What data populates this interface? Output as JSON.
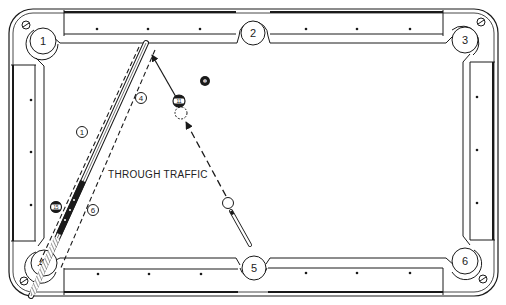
{
  "diagram": {
    "caption": "THROUGH TRAFFIC",
    "colors": {
      "ink": "#1a1a1a",
      "paper": "#ffffff"
    },
    "pockets": [
      {
        "number": "1",
        "position": "top-left"
      },
      {
        "number": "2",
        "position": "top-middle"
      },
      {
        "number": "3",
        "position": "top-right"
      },
      {
        "number": "4",
        "position": "bottom-left"
      },
      {
        "number": "5",
        "position": "bottom-middle"
      },
      {
        "number": "6",
        "position": "bottom-right"
      }
    ],
    "balls": [
      {
        "number": "8",
        "type": "solid-black"
      },
      {
        "number": "11",
        "type": "stripe"
      },
      {
        "number": "15",
        "type": "stripe"
      },
      {
        "number": "",
        "type": "cue-ball"
      },
      {
        "number": "",
        "type": "ghost-ball"
      }
    ],
    "markers": [
      {
        "label": "1"
      },
      {
        "label": "4"
      },
      {
        "label": "6"
      }
    ],
    "paths": [
      {
        "name": "object-ball-path",
        "from": "11",
        "to": "pocket-1-direction",
        "style": "solid-arrow"
      },
      {
        "name": "cue-ball-path",
        "from": "cue-ball",
        "to": "ghost-ball",
        "style": "dashed-arrow"
      },
      {
        "name": "lane-left",
        "style": "dashed"
      },
      {
        "name": "lane-right",
        "style": "dashed"
      }
    ]
  }
}
